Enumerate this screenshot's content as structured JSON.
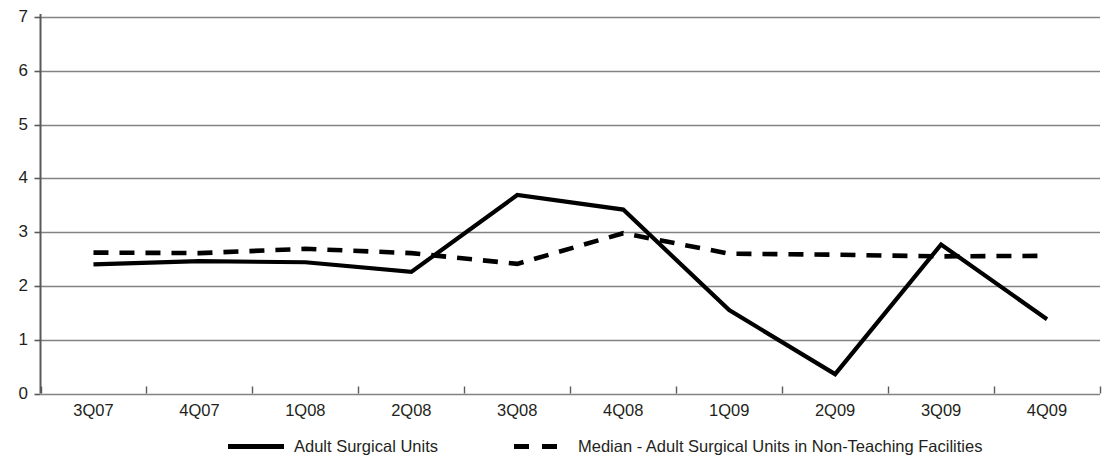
{
  "chart_data": {
    "type": "line",
    "title": "",
    "xlabel": "",
    "ylabel": "",
    "ylim": [
      0,
      7
    ],
    "yticks": [
      0,
      1,
      2,
      3,
      4,
      5,
      6,
      7
    ],
    "grid": true,
    "legend_position": "bottom",
    "categories": [
      "3Q07",
      "4Q07",
      "1Q08",
      "2Q08",
      "3Q08",
      "4Q08",
      "1Q09",
      "2Q09",
      "3Q09",
      "4Q09"
    ],
    "series": [
      {
        "name": "Adult Surgical Units",
        "style": "solid",
        "color": "#000000",
        "values": [
          2.4,
          2.46,
          2.44,
          2.26,
          3.69,
          3.42,
          1.55,
          0.36,
          2.77,
          1.38
        ]
      },
      {
        "name": "Median - Adult Surgical Units in Non-Teaching Facilities",
        "style": "dashed",
        "color": "#000000",
        "values": [
          2.62,
          2.61,
          2.69,
          2.61,
          2.41,
          2.98,
          2.6,
          2.58,
          2.55,
          2.56
        ]
      }
    ]
  },
  "axes": {
    "y_tick_labels": [
      "7",
      "6",
      "5",
      "4",
      "3",
      "2",
      "1",
      "0"
    ],
    "x_tick_labels": [
      "3Q07",
      "4Q07",
      "1Q08",
      "2Q08",
      "3Q08",
      "4Q08",
      "1Q09",
      "2Q09",
      "3Q09",
      "4Q09"
    ]
  },
  "legend": {
    "items": [
      {
        "label": "Adult Surgical Units",
        "style": "solid"
      },
      {
        "label": "Median - Adult Surgical Units in Non-Teaching Facilities",
        "style": "dashed"
      }
    ]
  },
  "colors": {
    "series_line": "#000000",
    "gridline": "#808285",
    "axis": "#58595b",
    "text": "#231f20",
    "background": "#ffffff"
  }
}
